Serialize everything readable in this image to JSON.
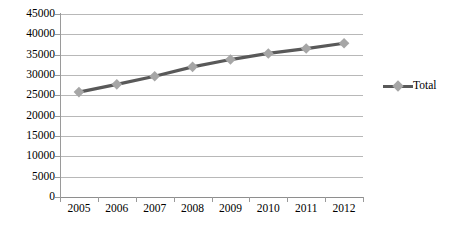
{
  "chart_data": {
    "type": "line",
    "title": "",
    "subtitle": "",
    "xlabel": "",
    "ylabel": "",
    "categories": [
      "2005",
      "2006",
      "2007",
      "2008",
      "2009",
      "2010",
      "2011",
      "2012"
    ],
    "series": [
      {
        "name": "Total",
        "values": [
          25800,
          27700,
          29700,
          32000,
          33800,
          35300,
          36500,
          37800
        ],
        "line_color": "#595959",
        "marker_color": "#a6a6a6",
        "marker_shape": "diamond"
      }
    ],
    "ylim": [
      0,
      45000
    ],
    "ytick_labels": [
      "0",
      "5000",
      "10000",
      "15000",
      "20000",
      "25000",
      "30000",
      "35000",
      "40000",
      "45000"
    ],
    "ytick_values": [
      0,
      5000,
      10000,
      15000,
      20000,
      25000,
      30000,
      35000,
      40000,
      45000
    ],
    "ytick_step": 5000,
    "grid": true,
    "grid_color": "#b8b8b8",
    "legend_position": "right",
    "legend_entries": [
      "Total"
    ],
    "plot_background": "#ffffff",
    "axis_color": "#9a9a9a"
  }
}
